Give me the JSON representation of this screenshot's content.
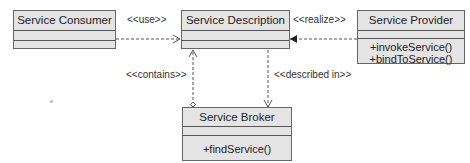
{
  "diagram": {
    "type": "UML class diagram",
    "classes": [
      {
        "id": "consumer",
        "name": "Service Consumer",
        "attributes": [],
        "operations": []
      },
      {
        "id": "description",
        "name": "Service Description",
        "attributes": [],
        "operations": []
      },
      {
        "id": "provider",
        "name": "Service Provider",
        "attributes": [],
        "operations": [
          "+invokeService()",
          "+bindToService()"
        ]
      },
      {
        "id": "broker",
        "name": "Service Broker",
        "attributes": [],
        "operations": [
          "+findService()"
        ]
      }
    ],
    "relationships": [
      {
        "from": "consumer",
        "to": "description",
        "label": "<<use>>",
        "style": "dashed",
        "arrow": "open"
      },
      {
        "from": "provider",
        "to": "description",
        "label": "<<realize>>",
        "style": "dashed",
        "arrow": "filled"
      },
      {
        "from": "broker",
        "to": "description",
        "label": "<<contains>>",
        "style": "dashed",
        "arrow": "open",
        "source_end": "hollow-diamond"
      },
      {
        "from": "description",
        "to": "broker",
        "label": "<<described in>>",
        "style": "dashed",
        "arrow": "open"
      }
    ]
  },
  "labels": {
    "use": "<<use>>",
    "realize": "<<realize>>",
    "contains": "<<contains>>",
    "described_in": "<<described in>>"
  },
  "colors": {
    "box_fill": "#e4e4e4",
    "box_border": "#666666",
    "line": "#555555"
  }
}
